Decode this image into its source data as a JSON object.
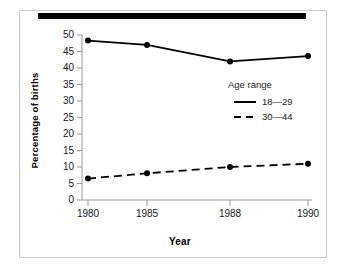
{
  "chart_data": {
    "type": "line",
    "title": "",
    "xlabel": "Year",
    "ylabel": "Percentage of births",
    "categories": [
      "1980",
      "1985",
      "1988",
      "1990"
    ],
    "x": [
      1980,
      1985,
      1988,
      1990
    ],
    "ylim": [
      0,
      50
    ],
    "yticks": [
      "0",
      "5",
      "10",
      "15",
      "20",
      "25",
      "30",
      "35",
      "40",
      "45",
      "50"
    ],
    "grid": false,
    "legend_position": "inside-right",
    "legend_title": "Age range",
    "series": [
      {
        "name": "18—29",
        "style": "solid",
        "marker": "filled-circle",
        "color": "#000000",
        "values": [
          48.3,
          47.0,
          42.0,
          43.6
        ]
      },
      {
        "name": "30—44",
        "style": "dashed",
        "marker": "filled-circle",
        "color": "#000000",
        "values": [
          6.5,
          8.1,
          10.0,
          11.0
        ]
      }
    ]
  },
  "figure": {
    "top_rule": "decorative-black-bar",
    "frame": "thin-gray-border",
    "background_color": "#ffffff",
    "axis_color": "#808080",
    "text_color": "#1a1a1a"
  }
}
